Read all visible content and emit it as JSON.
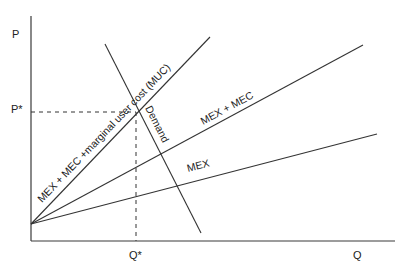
{
  "diagram": {
    "type": "economics-supply-demand",
    "axes": {
      "y_label": "P",
      "x_label": "Q",
      "y_marker": "P*",
      "x_marker": "Q*"
    },
    "curves": [
      {
        "id": "mex-mec-muc",
        "label": "MEX + MEC +marginal user cost (MUC)"
      },
      {
        "id": "mex-mec",
        "label": "MEX + MEC"
      },
      {
        "id": "mex",
        "label": "MEX"
      },
      {
        "id": "demand",
        "label": "Demand"
      }
    ],
    "equilibrium": {
      "price": "P*",
      "quantity": "Q*",
      "at": "intersection of Demand and MEX + MEC + MUC"
    }
  },
  "labels": {
    "p": "P",
    "p_star": "P*",
    "q": "Q",
    "q_star": "Q*",
    "curve_muc": "MEX + MEC +marginal user cost (MUC)",
    "curve_mec": "MEX + MEC",
    "curve_mex": "MEX",
    "curve_demand": "Demand"
  }
}
